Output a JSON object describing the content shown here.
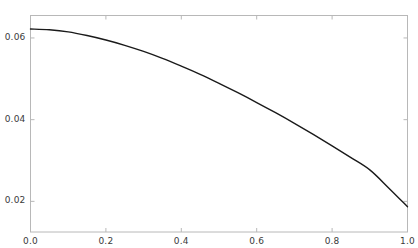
{
  "chart_data": {
    "type": "line",
    "title": "",
    "subtitle": "",
    "xlabel": "",
    "ylabel": "",
    "xlim": [
      0.0,
      1.0
    ],
    "ylim": [
      0.0125,
      0.0655
    ],
    "grid": false,
    "legend": null,
    "legend_position": "none",
    "xticks": [
      0.0,
      0.2,
      0.4,
      0.6,
      0.8,
      1.0
    ],
    "xtick_labels": [
      "0.0",
      "0.2",
      "0.4",
      "0.6",
      "0.8",
      "1.0"
    ],
    "yticks": [
      0.02,
      0.04,
      0.06
    ],
    "ytick_labels": [
      "0.02",
      "0.04",
      "0.06"
    ],
    "series": [
      {
        "name": "curve",
        "color": "#1a1a1a",
        "line_width": 1.4,
        "x": [
          0.0,
          0.05,
          0.1,
          0.15,
          0.2,
          0.25,
          0.3,
          0.35,
          0.4,
          0.45,
          0.5,
          0.55,
          0.6,
          0.65,
          0.7,
          0.75,
          0.8,
          0.85,
          0.9,
          0.95,
          1.0
        ],
        "y": [
          0.0622,
          0.062,
          0.0615,
          0.0606,
          0.0595,
          0.0582,
          0.0567,
          0.055,
          0.0531,
          0.0511,
          0.0489,
          0.0466,
          0.0442,
          0.0417,
          0.0391,
          0.0364,
          0.0336,
          0.0307,
          0.0277,
          0.0233,
          0.0187
        ]
      }
    ],
    "axes": {
      "frame_color": "#b5b5b5",
      "frame": [
        "left",
        "bottom",
        "top",
        "right"
      ],
      "tick_color": "#b5b5b5"
    }
  },
  "figure": {
    "background_color": "#ffffff",
    "width": 418,
    "height": 248
  }
}
